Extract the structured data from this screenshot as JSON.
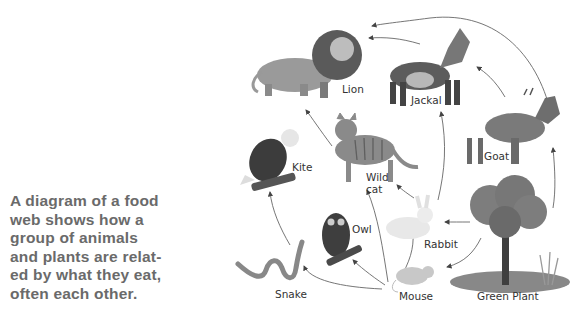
{
  "caption": {
    "lines": [
      "A diagram of a food",
      "web shows how a",
      "group of animals",
      "and plants are relat-",
      "ed by what they eat,",
      "often each other."
    ]
  },
  "diagram": {
    "title": "Food web",
    "nodes": [
      {
        "id": "lion",
        "label": "Lion"
      },
      {
        "id": "jackal",
        "label": "Jackal"
      },
      {
        "id": "goat",
        "label": "Goat"
      },
      {
        "id": "kite",
        "label": "Kite"
      },
      {
        "id": "wildcat",
        "label_line1": "Wild",
        "label_line2": "cat"
      },
      {
        "id": "rabbit",
        "label": "Rabbit"
      },
      {
        "id": "owl",
        "label": "Owl"
      },
      {
        "id": "snake",
        "label": "Snake"
      },
      {
        "id": "mouse",
        "label": "Mouse"
      },
      {
        "id": "plant",
        "label": "Green Plant"
      }
    ],
    "edges": [
      {
        "from": "plant",
        "to": "rabbit"
      },
      {
        "from": "plant",
        "to": "mouse"
      },
      {
        "from": "plant",
        "to": "goat"
      },
      {
        "from": "goat",
        "to": "jackal"
      },
      {
        "from": "goat",
        "to": "lion"
      },
      {
        "from": "jackal",
        "to": "lion"
      },
      {
        "from": "rabbit",
        "to": "jackal"
      },
      {
        "from": "rabbit",
        "to": "wildcat"
      },
      {
        "from": "mouse",
        "to": "rabbit"
      },
      {
        "from": "mouse",
        "to": "owl"
      },
      {
        "from": "mouse",
        "to": "snake"
      },
      {
        "from": "mouse",
        "to": "wildcat"
      },
      {
        "from": "wildcat",
        "to": "lion"
      },
      {
        "from": "snake",
        "to": "kite"
      }
    ]
  }
}
